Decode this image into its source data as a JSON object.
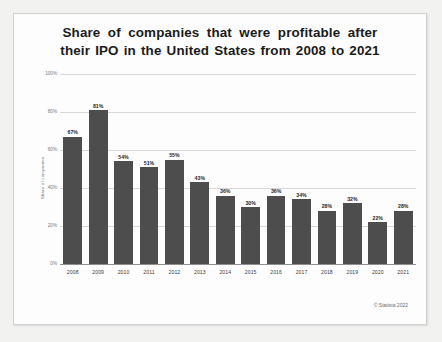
{
  "chart_data": {
    "type": "bar",
    "title_line1": "Share  of  companies  that  were profitable after",
    "title_line2": "their IPO in the United States from 2008 to 2021",
    "title_full": "Share of companies that were profitable after their IPO in the United States from 2008 to 2021",
    "xlabel": "",
    "ylabel": "Share of companies",
    "categories": [
      "2008",
      "2009",
      "2010",
      "2011",
      "2012",
      "2013",
      "2014",
      "2015",
      "2016",
      "2017",
      "2018",
      "2019",
      "2020",
      "2021"
    ],
    "values": [
      67,
      81,
      54,
      51,
      55,
      43,
      36,
      30,
      36,
      34,
      28,
      32,
      22,
      28
    ],
    "value_labels": [
      "67%",
      "81%",
      "54%",
      "51%",
      "55%",
      "43%",
      "36%",
      "30%",
      "36%",
      "34%",
      "28%",
      "32%",
      "22%",
      "28%"
    ],
    "ylim": [
      0,
      100
    ],
    "yticks": [
      0,
      20,
      40,
      60,
      80,
      100
    ],
    "ytick_labels": [
      "0%",
      "20%",
      "40%",
      "60%",
      "80%",
      "100%"
    ],
    "grid": true,
    "legend": "none",
    "bar_color": "#4d4d4d",
    "gridline_color": "#d8d8d8",
    "axis_color": "#8f8f8f",
    "background_color": "#fdfdfd"
  },
  "credit": {
    "text": "© Statista 2022"
  }
}
